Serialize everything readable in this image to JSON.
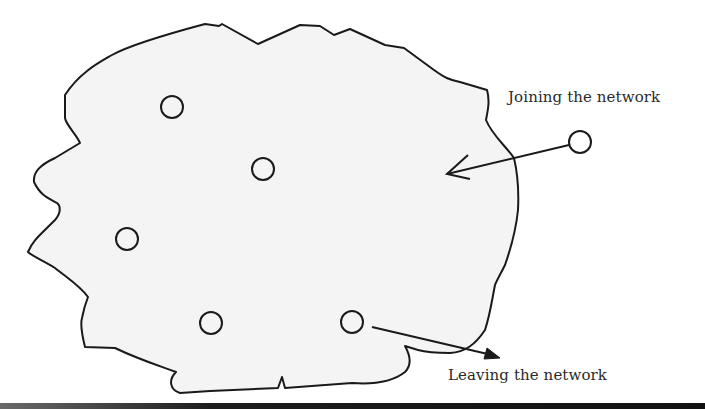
{
  "diagram": {
    "type": "network-membership",
    "region": {
      "fill": "#f4f4f4",
      "stroke": "#1a1a1a",
      "description": "irregular cloud-shaped network region"
    },
    "nodes_inside": [
      {
        "cx": 172,
        "cy": 107,
        "r": 11
      },
      {
        "cx": 263,
        "cy": 169,
        "r": 11
      },
      {
        "cx": 127,
        "cy": 239,
        "r": 11
      },
      {
        "cx": 211,
        "cy": 323,
        "r": 11
      },
      {
        "cx": 352,
        "cy": 322,
        "r": 11
      }
    ],
    "node_outside": {
      "cx": 580,
      "cy": 142,
      "r": 11
    },
    "labels": {
      "joining": "Joining the network",
      "leaving": "Leaving the network"
    },
    "arrows": {
      "joining": {
        "from": [
          568,
          144
        ],
        "to": [
          447,
          174
        ],
        "head": "open"
      },
      "leaving": {
        "from": [
          372,
          327
        ],
        "to": [
          500,
          357
        ],
        "head": "filled"
      }
    },
    "colors": {
      "stroke": "#1a1a1a",
      "text": "#2a2a2a",
      "background": "#ffffff"
    }
  }
}
